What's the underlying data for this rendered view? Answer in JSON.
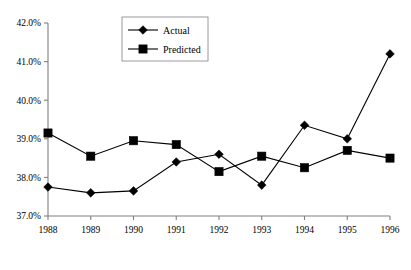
{
  "chart_data": {
    "type": "line",
    "title": "",
    "xlabel": "",
    "ylabel": "",
    "categories": [
      "1988",
      "1989",
      "1990",
      "1991",
      "1992",
      "1993",
      "1994",
      "1995",
      "1996"
    ],
    "ylim": [
      37.0,
      42.0
    ],
    "ytick_values": [
      37.0,
      38.0,
      39.0,
      40.0,
      41.0,
      42.0
    ],
    "ytick_labels": [
      "37.0%",
      "38.0%",
      "39.0%",
      "40.0%",
      "41.0%",
      "42.0%"
    ],
    "grid": false,
    "legend_position": "top-center",
    "series": [
      {
        "name": "Actual",
        "marker": "diamond",
        "color": "#000000",
        "values": [
          37.75,
          37.6,
          37.65,
          38.4,
          38.6,
          37.8,
          39.35,
          39.0,
          41.2
        ]
      },
      {
        "name": "Predicted",
        "marker": "square",
        "color": "#000000",
        "values": [
          39.15,
          38.55,
          38.95,
          38.85,
          38.15,
          38.55,
          38.25,
          38.7,
          38.5
        ]
      }
    ]
  },
  "legend": {
    "entries": [
      {
        "label": "Actual",
        "marker": "diamond"
      },
      {
        "label": "Predicted",
        "marker": "square"
      }
    ]
  }
}
